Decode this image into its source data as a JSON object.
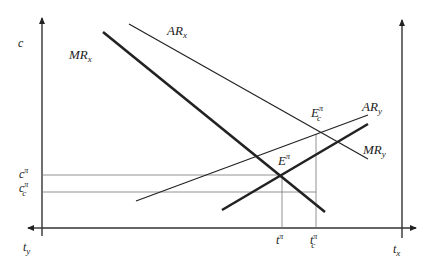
{
  "diagram": {
    "type": "economics-two-sided-market",
    "axes": {
      "left_vertical_label": "c",
      "bottom_left_label": "t",
      "bottom_left_label_sub": "y",
      "bottom_right_label": "t",
      "bottom_right_label_sub": "x"
    },
    "curves": [
      {
        "id": "MRx",
        "label": "MR",
        "sub": "x",
        "weight": "thick",
        "from": [
          103,
          32
        ],
        "to": [
          325,
          212
        ]
      },
      {
        "id": "ARx",
        "label": "AR",
        "sub": "x",
        "weight": "thin",
        "from": [
          129,
          24
        ],
        "to": [
          368,
          159
        ]
      },
      {
        "id": "ARy",
        "label": "AR",
        "sub": "y",
        "weight": "thin",
        "from": [
          136,
          201
        ],
        "to": [
          368,
          115
        ]
      },
      {
        "id": "MRy",
        "label": "MR",
        "sub": "y",
        "weight": "thick",
        "from": [
          222,
          210
        ],
        "to": [
          368,
          124
        ]
      }
    ],
    "points": [
      {
        "id": "E",
        "label": "E",
        "sup": "π",
        "sub": "",
        "at": [
          280,
          176
        ]
      },
      {
        "id": "Ec",
        "label": "E",
        "sup": "π",
        "sub": "c",
        "at": [
          318,
          134
        ]
      }
    ],
    "y_marks": [
      {
        "label": "c",
        "sup": "π",
        "sub": "",
        "y": 175
      },
      {
        "label": "c",
        "sup": "π",
        "sub": "c",
        "y": 192
      }
    ],
    "x_marks": [
      {
        "label": "t",
        "sup": "π",
        "sub": "",
        "x": 282
      },
      {
        "label": "t",
        "sup": "π",
        "sub": "c",
        "x": 316
      }
    ],
    "colors": {
      "line": "#222222",
      "guide": "#666666"
    }
  }
}
